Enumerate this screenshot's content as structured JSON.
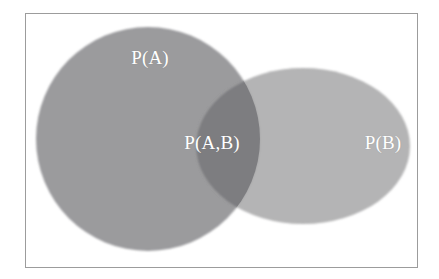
{
  "figure": {
    "type": "venn-diagram",
    "width": 439,
    "height": 279,
    "background_color": "#ffffff",
    "frame": {
      "name": "diagram-border",
      "x": 25,
      "y": 13,
      "width": 393,
      "height": 255,
      "border_color": "#9c9c9c",
      "border_width": 1,
      "fill": "#ffffff"
    }
  },
  "chart_data": {
    "type": "venn",
    "title": "",
    "xlabel": "",
    "ylabel": "",
    "grid": false,
    "legend": "none",
    "sets": [
      {
        "id": "A",
        "label": "P(A)",
        "shape": "circle",
        "cx": 148,
        "cy": 139,
        "r": 112,
        "fill": "#969698",
        "opacity": 0.95,
        "label_x": 150,
        "label_y": 57,
        "label_color": "#ffffff"
      },
      {
        "id": "B",
        "label": "P(B)",
        "shape": "ellipse",
        "cx": 303,
        "cy": 146,
        "rx": 107,
        "ry": 78,
        "fill": "#a3a3a5",
        "opacity": 0.82,
        "label_x": 383,
        "label_y": 142,
        "label_color": "#ffffff"
      }
    ],
    "intersection": {
      "id": "AB",
      "label": "P(A,B)",
      "fill": "#7d7d80",
      "label_x": 212,
      "label_y": 142,
      "label_color": "#ffffff"
    }
  },
  "labels": {
    "set_a": "P(A)",
    "set_b": "P(B)",
    "intersection": "P(A,B)"
  },
  "colors": {
    "page_background": "#ffffff",
    "frame_border": "#9c9c9c",
    "set_a_fill": "#969698",
    "set_b_fill": "#a3a3a5",
    "intersection_fill": "#7d7d80",
    "label_text": "#ffffff"
  }
}
